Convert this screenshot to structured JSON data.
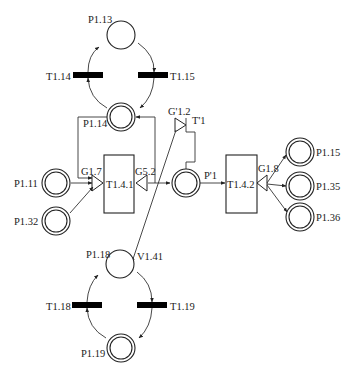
{
  "diagram": {
    "type": "petri-net",
    "places": {
      "p113": {
        "label": "P1.13",
        "double": false
      },
      "p114": {
        "label": "P1.14",
        "double": true
      },
      "p111": {
        "label": "P1.11",
        "double": true
      },
      "p132": {
        "label": "P1.32",
        "double": true
      },
      "pprime1": {
        "label": "P'1",
        "double": true
      },
      "p115": {
        "label": "P1.15",
        "double": true
      },
      "p135": {
        "label": "P1.35",
        "double": true
      },
      "p136": {
        "label": "P1.36",
        "double": true
      },
      "p118": {
        "label": "P1.18",
        "double": false
      },
      "p119": {
        "label": "P1.19",
        "double": true
      }
    },
    "transitions": {
      "t114": {
        "label": "T1.14"
      },
      "t115": {
        "label": "T1.15"
      },
      "t118": {
        "label": "T1.18"
      },
      "t119": {
        "label": "T1.19"
      },
      "t141": {
        "label": "T1.4.1"
      },
      "t142": {
        "label": "T1.4.2"
      },
      "tprime1": {
        "label": "T'1"
      }
    },
    "gates": {
      "g17": {
        "label": "G1.7"
      },
      "g52": {
        "label": "G5.2"
      },
      "g18": {
        "label": "G1.8"
      },
      "gprime12": {
        "label": "G'1.2"
      }
    },
    "annotations": {
      "v141": {
        "label": "V1.41"
      }
    }
  }
}
